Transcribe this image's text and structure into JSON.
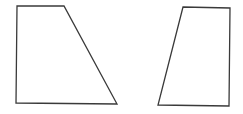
{
  "diagram": {
    "title": "",
    "stroke_color": "#3a3a3a",
    "background": "#ffffff",
    "shapes": [
      {
        "name": "left-trapezoid",
        "points": "17,6 64,6 117,104 16,103"
      },
      {
        "name": "right-trapezoid",
        "points": "183,7 230,8 229,106 158,105"
      }
    ]
  }
}
